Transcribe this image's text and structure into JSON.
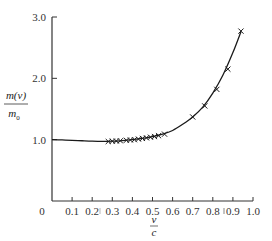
{
  "chart_data": {
    "type": "line",
    "title": "",
    "xlabel": "v/c",
    "xlabel_numerator": "v",
    "xlabel_denominator": "c",
    "ylabel": "m(v)/m0",
    "ylabel_numerator": "m(v)",
    "ylabel_denominator": "m",
    "ylabel_denominator_sub": "0",
    "xlim": [
      0,
      1.0
    ],
    "ylim": [
      0,
      3.0
    ],
    "grid": false,
    "legend": null,
    "x_origin_label": "0",
    "x_ticks": [
      0.1,
      0.2,
      0.3,
      0.4,
      0.5,
      0.6,
      0.7,
      0.8,
      0.9,
      1.0
    ],
    "x_tick_labels": [
      "0.1",
      "0.2",
      "0.3",
      "0.4",
      "0.5",
      "0.6",
      "0.7",
      "0.8",
      "0.9",
      "1.0"
    ],
    "y_ticks": [
      1.0,
      2.0,
      3.0
    ],
    "y_tick_labels": [
      "1.0",
      "2.0",
      "3.0"
    ],
    "series": [
      {
        "name": "fitted curve",
        "style": "solid line",
        "x": [
          0.0,
          0.05,
          0.1,
          0.15,
          0.2,
          0.25,
          0.3,
          0.35,
          0.4,
          0.45,
          0.5,
          0.55,
          0.6,
          0.65,
          0.7,
          0.75,
          0.8,
          0.85,
          0.9,
          0.94
        ],
        "y": [
          1.0,
          0.995,
          0.99,
          0.982,
          0.975,
          0.972,
          0.975,
          0.985,
          1.0,
          1.02,
          1.05,
          1.09,
          1.15,
          1.25,
          1.37,
          1.53,
          1.76,
          2.05,
          2.42,
          2.76
        ]
      },
      {
        "name": "measurements",
        "style": "x markers",
        "x": [
          0.28,
          0.3,
          0.32,
          0.34,
          0.37,
          0.39,
          0.41,
          0.43,
          0.45,
          0.47,
          0.49,
          0.51,
          0.53,
          0.56,
          0.7,
          0.76,
          0.82,
          0.875,
          0.94
        ],
        "y": [
          0.97,
          0.975,
          0.978,
          0.982,
          0.99,
          0.995,
          1.0,
          1.01,
          1.02,
          1.03,
          1.04,
          1.05,
          1.065,
          1.09,
          1.37,
          1.55,
          1.82,
          2.15,
          2.77
        ]
      }
    ],
    "annotations": [
      {
        "text": "|",
        "near_x": 0.25,
        "note": "small vertical mark between 0.2 and 0.3 labels"
      },
      {
        "text": "|",
        "near_x": 0.85,
        "note": "small vertical mark between 0.8 and 0.9 labels"
      }
    ]
  },
  "colors": {
    "line": "#1a1a1a",
    "marker": "#1a1a1a",
    "axis": "#333333",
    "text": "#333333",
    "background": "#ffffff"
  },
  "plot_geometry": {
    "x0_px": 52,
    "x1_px": 253,
    "y0_px": 201,
    "y3_px": 17
  }
}
